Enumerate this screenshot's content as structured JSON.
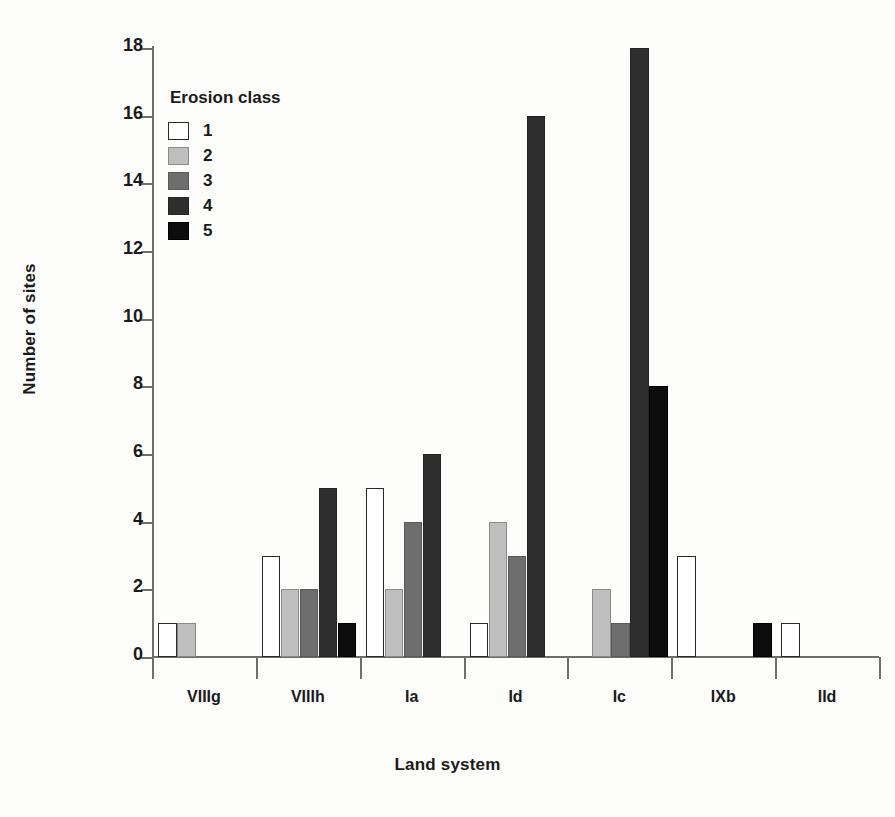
{
  "chart_data": {
    "type": "bar",
    "title": "",
    "xlabel": "Land system",
    "ylabel": "Number of sites",
    "categories": [
      "VIIIg",
      "VIIIh",
      "Ia",
      "Id",
      "Ic",
      "IXb",
      "IId"
    ],
    "ylim": [
      0,
      18
    ],
    "yticks": [
      0,
      2,
      4,
      6,
      8,
      10,
      12,
      14,
      16,
      18
    ],
    "ytick_labels": [
      "0",
      "2",
      "4",
      "6",
      "8",
      "10",
      "12",
      "14",
      "16",
      "18"
    ],
    "grid": false,
    "legend_title": "Erosion class",
    "legend_position": "upper-left-inside",
    "series": [
      {
        "name": "1",
        "color": "#ffffff",
        "edge": "#2a2a2a",
        "values": [
          1,
          3,
          5,
          1,
          0,
          3,
          1
        ]
      },
      {
        "name": "2",
        "color": "#bfbfbf",
        "edge": "#8a8a8a",
        "values": [
          1,
          2,
          2,
          4,
          2,
          0,
          0
        ]
      },
      {
        "name": "3",
        "color": "#6e6e6e",
        "edge": "#5a5a5a",
        "values": [
          0,
          2,
          4,
          3,
          1,
          0,
          0
        ]
      },
      {
        "name": "4",
        "color": "#2e2e2e",
        "edge": "#242424",
        "values": [
          0,
          5,
          6,
          16,
          18,
          0,
          0
        ]
      },
      {
        "name": "5",
        "color": "#0d0d0d",
        "edge": "#000000",
        "values": [
          0,
          1,
          0,
          0,
          8,
          1,
          0
        ]
      }
    ]
  },
  "axis": {
    "y_title": "Number of sites",
    "x_title": "Land system"
  },
  "legend": {
    "title": "Erosion class",
    "entries": [
      {
        "label": "1"
      },
      {
        "label": "2"
      },
      {
        "label": "3"
      },
      {
        "label": "4"
      },
      {
        "label": "5"
      }
    ]
  }
}
